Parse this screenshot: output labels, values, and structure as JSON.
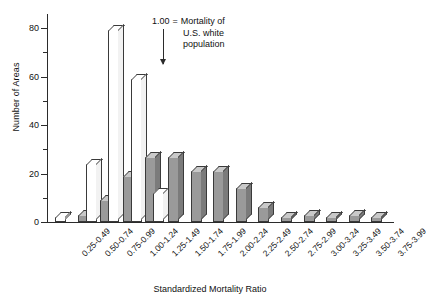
{
  "chart_data": {
    "type": "bar",
    "title": "",
    "xlabel": "Standardized Mortality Ratio",
    "ylabel": "Number of Areas",
    "ylim": [
      0,
      85
    ],
    "yticks": [
      0,
      20,
      40,
      60,
      80
    ],
    "yminorticks": [
      10,
      30,
      50,
      70
    ],
    "grid": false,
    "legend_position": "none",
    "categories": [
      "0.25-0.49",
      "0.50-0.74",
      "0.75-0.99",
      "1.00-1.24",
      "1.25-1.49",
      "1.50-1.74",
      "1.75-1.99",
      "2.00-2.24",
      "2.25-2.49",
      "2.50-2.74",
      "2.75-2.99",
      "3.00-3.24",
      "3.25-3.49",
      "3.50-3.74",
      "3.75-3.99"
    ],
    "series": [
      {
        "name": "open",
        "fill": "#ffffff",
        "values": [
          2,
          24,
          79,
          59,
          12,
          0,
          0,
          0,
          0,
          0,
          0,
          0,
          0,
          0,
          0
        ]
      },
      {
        "name": "shaded",
        "fill": "#9a9a9a",
        "values": [
          0,
          3,
          9,
          19,
          27,
          27,
          21,
          21,
          14,
          6,
          2,
          3,
          2,
          3,
          2
        ]
      }
    ],
    "annotations": [
      {
        "value_label": "1.00",
        "equals": "=",
        "text_lines": [
          "Mortality of",
          "U.S. white",
          "population"
        ],
        "points_to_category": "1.00-1.24"
      }
    ]
  },
  "colors": {
    "axis": "#2b2b2b",
    "bar_outline": "#3a3a3a",
    "bar_open_face": "#ffffff",
    "bar_open_top": "#ffffff",
    "bar_open_side": "#f2f2f2",
    "bar_shaded_face": "#9a9a9a",
    "bar_shaded_top": "#c9c9c9",
    "bar_shaded_side": "#7b7b7b",
    "background": "#ffffff",
    "text": "#111111"
  }
}
